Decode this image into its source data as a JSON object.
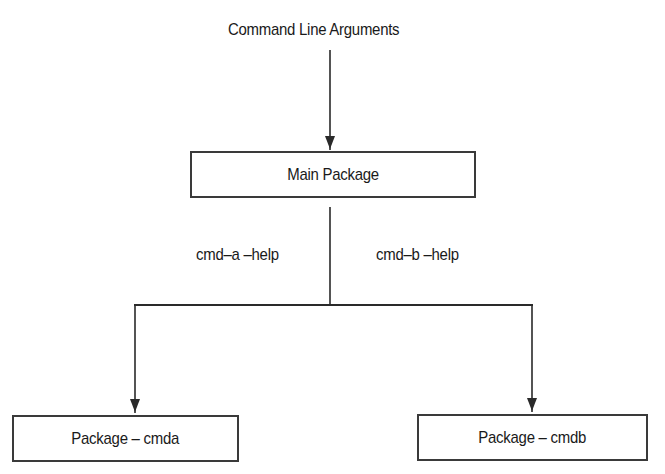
{
  "diagram": {
    "title": "Command Line Arguments",
    "main_box": {
      "label": "Main Package"
    },
    "branch_labels": {
      "left": "cmd–a –help",
      "right": "cmd–b –help"
    },
    "children": [
      {
        "label": "Package – cmda"
      },
      {
        "label": "Package – cmdb"
      }
    ],
    "colors": {
      "line": "#2a2a2a",
      "box_border": "#3a3a3a",
      "text": "#1a1a1a",
      "background": "#ffffff"
    }
  }
}
